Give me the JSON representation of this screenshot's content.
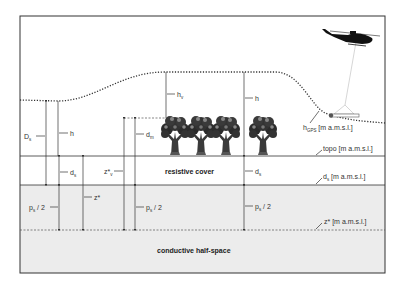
{
  "diagram": {
    "colors": {
      "frame": "#333333",
      "lower_fill": "#ececec",
      "line": "#333333",
      "label": "#333333",
      "tether": "#bbbbbb"
    },
    "layers": {
      "resistive_cover": "resistive cover",
      "conductive_half_space": "conductive half-space"
    },
    "right_labels": {
      "topo": "topo [m a.m.s.l.]",
      "ds_main": "d",
      "ds_sub": "s",
      "ds_unit": " [m a.m.s.l.]",
      "zstar": "z* [m a.m.s.l.]",
      "hgps_main": "h",
      "hgps_sub": "GPS",
      "hgps_unit": " [m a.m.s.l.]"
    },
    "dimension_labels": {
      "Ds_main": "D",
      "Ds_sub": "s",
      "h": "h",
      "ds_main": "d",
      "ds_sub": "s",
      "ps2_main": "p",
      "ps2_sub": "s",
      "ps2_tail": " / 2",
      "zstar": "z*",
      "zstarv_main": "z*",
      "zstarv_sub": "v",
      "dm_main": "d",
      "dm_sub": "m",
      "hv_main": "h",
      "hv_sub": "v"
    },
    "icons": [
      "helicopter-icon",
      "tree-icon",
      "em-bird-sensor-icon"
    ]
  }
}
